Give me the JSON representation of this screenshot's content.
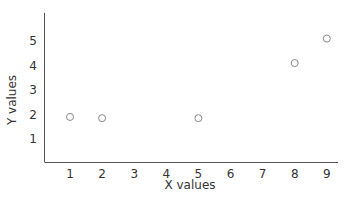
{
  "chart_data": {
    "type": "scatter",
    "title": "",
    "xlabel": "X values",
    "ylabel": "Y values",
    "x_ticks": [
      1,
      2,
      3,
      4,
      5,
      6,
      7,
      8,
      9
    ],
    "y_ticks": [
      1,
      2,
      3,
      4,
      5
    ],
    "xlim": [
      0.2,
      9.5
    ],
    "ylim": [
      0.2,
      6
    ],
    "grid": false,
    "legend": null,
    "series": [
      {
        "name": "data",
        "marker": "open-circle",
        "color": "#888888",
        "x": [
          1,
          2,
          5,
          8,
          9
        ],
        "y": [
          1.9,
          1.85,
          1.85,
          4.1,
          5.1
        ]
      }
    ]
  }
}
